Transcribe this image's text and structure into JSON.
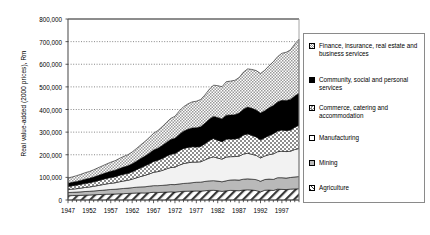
{
  "chart_data": {
    "type": "area",
    "stacked": true,
    "title": "",
    "xlabel": "",
    "ylabel": "Real value-added (2000 prices), Rm",
    "ylim": [
      0,
      800000
    ],
    "ytick_values": [
      0,
      100000,
      200000,
      300000,
      400000,
      500000,
      600000,
      700000,
      800000
    ],
    "ytick_labels": [
      "0",
      "100,000",
      "200,000",
      "300,000",
      "400,000",
      "500,000",
      "600,000",
      "700,000",
      "800,000"
    ],
    "xlim": [
      1947,
      2001
    ],
    "xtick_labels": [
      "1947",
      "1952",
      "1957",
      "1962",
      "1967",
      "1972",
      "1977",
      "1982",
      "1987",
      "1992",
      "1997"
    ],
    "xtick_values": [
      1947,
      1952,
      1957,
      1962,
      1967,
      1972,
      1977,
      1982,
      1987,
      1992,
      1997
    ],
    "grid": "horizontal-dotted",
    "legend_position": "right",
    "x": [
      1947,
      1948,
      1949,
      1950,
      1951,
      1952,
      1953,
      1954,
      1955,
      1956,
      1957,
      1958,
      1959,
      1960,
      1961,
      1962,
      1963,
      1964,
      1965,
      1966,
      1967,
      1968,
      1969,
      1970,
      1971,
      1972,
      1973,
      1974,
      1975,
      1976,
      1977,
      1978,
      1979,
      1980,
      1981,
      1982,
      1983,
      1984,
      1985,
      1986,
      1987,
      1988,
      1989,
      1990,
      1991,
      1992,
      1993,
      1994,
      1995,
      1996,
      1997,
      1998,
      1999,
      2000,
      2001
    ],
    "series": [
      {
        "name": "Agriculture",
        "pattern": "diagonal-hatch",
        "values": [
          19000,
          19500,
          20000,
          20500,
          21500,
          22000,
          23000,
          24000,
          24500,
          25500,
          26000,
          26500,
          27500,
          28000,
          29000,
          30000,
          31000,
          31500,
          31000,
          32500,
          34000,
          33500,
          34000,
          35000,
          36000,
          35000,
          37000,
          38500,
          39000,
          39500,
          40000,
          39500,
          41000,
          42500,
          43000,
          41500,
          38000,
          41000,
          42500,
          42000,
          41000,
          44000,
          45000,
          44000,
          41500,
          36000,
          43000,
          44000,
          42000,
          48000,
          47000,
          46000,
          48000,
          49000,
          50000
        ]
      },
      {
        "name": "Mining",
        "pattern": "light-gray",
        "values": [
          14000,
          14500,
          15000,
          15500,
          16000,
          16500,
          17000,
          17500,
          18500,
          19500,
          20500,
          21000,
          22000,
          23000,
          23500,
          24500,
          25500,
          26500,
          27500,
          28500,
          29500,
          30000,
          30500,
          31500,
          32500,
          33000,
          34000,
          34500,
          35500,
          37000,
          38500,
          39500,
          41000,
          42000,
          42500,
          42000,
          42500,
          44000,
          46000,
          47000,
          47000,
          48000,
          48500,
          48000,
          48500,
          47000,
          47500,
          48500,
          49000,
          50500,
          51500,
          51000,
          51500,
          53000,
          53500
        ]
      },
      {
        "name": "Manufacturing",
        "pattern": "white",
        "values": [
          13000,
          14000,
          15000,
          16500,
          18000,
          19000,
          20500,
          22500,
          24500,
          26000,
          27500,
          28500,
          31000,
          33000,
          34500,
          37500,
          41500,
          46000,
          50500,
          54000,
          59000,
          62000,
          66000,
          71000,
          75000,
          77000,
          83000,
          88000,
          90000,
          91000,
          89000,
          90000,
          95000,
          101000,
          105000,
          102000,
          100000,
          105000,
          103000,
          103000,
          106000,
          111000,
          113000,
          110000,
          107000,
          103000,
          104000,
          108000,
          113000,
          115000,
          117000,
          117000,
          116000,
          121000,
          124000
        ]
      },
      {
        "name": "Commerce, catering and accommodation",
        "pattern": "checker",
        "values": [
          14000,
          15000,
          16000,
          17000,
          18000,
          19000,
          20000,
          21500,
          23000,
          24500,
          26000,
          27000,
          28500,
          30000,
          31000,
          33000,
          36000,
          39000,
          42000,
          45000,
          48000,
          50000,
          53000,
          56000,
          59000,
          60000,
          64000,
          67000,
          68000,
          68000,
          67000,
          68000,
          72000,
          77000,
          81000,
          79000,
          77000,
          80000,
          78000,
          78000,
          80000,
          84000,
          86000,
          84000,
          82000,
          80000,
          81000,
          85000,
          89000,
          92000,
          94000,
          93000,
          94000,
          99000,
          103000
        ]
      },
      {
        "name": "Community, social and personal services",
        "pattern": "black",
        "values": [
          14000,
          15000,
          16000,
          17000,
          18500,
          19500,
          21000,
          22500,
          24000,
          25500,
          27000,
          28500,
          30000,
          31500,
          33000,
          35000,
          37500,
          40500,
          43500,
          47000,
          50500,
          53500,
          57000,
          61000,
          65000,
          68000,
          72000,
          76000,
          80000,
          83000,
          85000,
          87000,
          90000,
          94000,
          98000,
          100000,
          101000,
          105000,
          106000,
          107000,
          110000,
          114000,
          118000,
          119000,
          119000,
          118000,
          119000,
          122000,
          125000,
          128000,
          131000,
          133000,
          135000,
          138000,
          141000
        ]
      },
      {
        "name": "Finance, insurance, real estate and business services",
        "pattern": "fine-dot",
        "values": [
          23000,
          24000,
          25500,
          27000,
          28500,
          30000,
          32000,
          34000,
          36000,
          38000,
          40000,
          42000,
          44500,
          47000,
          49000,
          52000,
          56000,
          60000,
          64500,
          69000,
          74000,
          78000,
          83000,
          88000,
          93000,
          97000,
          103000,
          108000,
          112000,
          115000,
          117000,
          120000,
          125000,
          132000,
          138000,
          141000,
          142000,
          148000,
          150000,
          152000,
          157000,
          164000,
          169000,
          172000,
          174000,
          175000,
          179000,
          186000,
          193000,
          200000,
          208000,
          213000,
          219000,
          229000,
          239000
        ]
      }
    ]
  },
  "legend": {
    "items": [
      {
        "label": "Finance, insurance, real estate and business services",
        "pattern": "fine-dot"
      },
      {
        "label": "Community, social and personal services",
        "pattern": "black"
      },
      {
        "label": "Commerce, catering and accommodation",
        "pattern": "checker"
      },
      {
        "label": "Manufacturing",
        "pattern": "white"
      },
      {
        "label": "Mining",
        "pattern": "light-gray"
      },
      {
        "label": "Agriculture",
        "pattern": "diagonal-hatch"
      }
    ]
  }
}
